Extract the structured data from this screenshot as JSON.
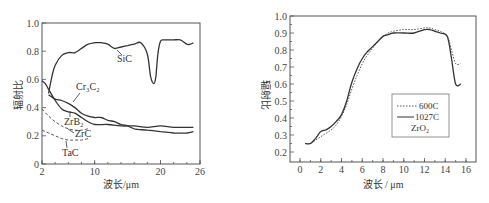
{
  "chart_data": [
    {
      "type": "line",
      "title": "",
      "xlabel": "波长/μm",
      "ylabel": "辐射比",
      "xlim": [
        2,
        26
      ],
      "ylim": [
        0,
        1.0
      ],
      "x_ticks": [
        "2",
        "10",
        "20",
        "26"
      ],
      "x_tick_values": [
        2,
        10,
        20,
        26
      ],
      "y_ticks": [
        "0",
        "0.2",
        "0.4",
        "0.6",
        "0.8",
        "1.0"
      ],
      "y_tick_values": [
        0,
        0.2,
        0.4,
        0.6,
        0.8,
        1.0
      ],
      "grid": false,
      "series": [
        {
          "name": "SiC",
          "style": "solid",
          "label": "SiC",
          "x": [
            3,
            3.5,
            4,
            5,
            6,
            7,
            8,
            9,
            10,
            11,
            12,
            13,
            14,
            15,
            16,
            17,
            18,
            18.5,
            19,
            19.3,
            19.6,
            20,
            20.5,
            21,
            22,
            23,
            24,
            24.5,
            25
          ],
          "y": [
            0.5,
            0.62,
            0.7,
            0.77,
            0.79,
            0.79,
            0.82,
            0.85,
            0.86,
            0.86,
            0.85,
            0.82,
            0.83,
            0.84,
            0.85,
            0.86,
            0.78,
            0.62,
            0.57,
            0.62,
            0.78,
            0.87,
            0.88,
            0.88,
            0.88,
            0.88,
            0.85,
            0.85,
            0.86
          ]
        },
        {
          "name": "Cr3C2",
          "style": "solid",
          "label": "Cr₃C₂",
          "x": [
            3,
            4,
            5,
            6,
            7,
            8,
            9,
            10,
            11,
            12,
            13,
            14,
            15,
            16,
            18,
            20,
            22,
            24,
            25
          ],
          "y": [
            0.49,
            0.46,
            0.45,
            0.43,
            0.4,
            0.36,
            0.34,
            0.33,
            0.33,
            0.31,
            0.3,
            0.28,
            0.27,
            0.25,
            0.24,
            0.23,
            0.22,
            0.22,
            0.23
          ]
        },
        {
          "name": "ZrB2",
          "style": "solid",
          "label": "ZrB₂",
          "x": [
            2,
            2.5,
            3,
            4,
            5,
            6,
            7,
            8,
            9,
            10,
            12,
            14,
            16,
            18,
            20,
            22,
            24,
            25
          ],
          "y": [
            0.59,
            0.57,
            0.53,
            0.45,
            0.39,
            0.37,
            0.36,
            0.33,
            0.3,
            0.28,
            0.28,
            0.27,
            0.27,
            0.26,
            0.27,
            0.26,
            0.26,
            0.26
          ]
        },
        {
          "name": "ZrC",
          "style": "dashed",
          "label": "ZrC",
          "x": [
            2,
            3,
            4,
            5,
            6,
            7,
            8,
            9
          ],
          "y": [
            0.39,
            0.34,
            0.3,
            0.27,
            0.25,
            0.24,
            0.24,
            0.25
          ]
        },
        {
          "name": "TaC",
          "style": "dashed",
          "label": "TaC",
          "x": [
            2,
            3,
            4,
            5,
            6,
            7,
            8,
            9
          ],
          "y": [
            0.24,
            0.22,
            0.2,
            0.18,
            0.17,
            0.17,
            0.17,
            0.18
          ]
        }
      ]
    },
    {
      "type": "line",
      "title": "",
      "xlabel": "波长 / μm",
      "ylabel": "辐射比",
      "xlim": [
        -1,
        17
      ],
      "ylim": [
        0.15,
        1.0
      ],
      "x_ticks": [
        "0",
        "2",
        "4",
        "6",
        "8",
        "10",
        "12",
        "14",
        "16"
      ],
      "x_tick_values": [
        0,
        2,
        4,
        6,
        8,
        10,
        12,
        14,
        16
      ],
      "y_ticks": [
        "0.2",
        "0.3",
        "0.4",
        "0.5",
        "0.6",
        "0.7",
        "0.8",
        "0.9",
        "1.0"
      ],
      "y_tick_values": [
        0.2,
        0.3,
        0.4,
        0.5,
        0.6,
        0.7,
        0.8,
        0.9,
        1.0
      ],
      "grid": false,
      "legend": {
        "position": "lower-right",
        "title": "ZrO₂",
        "entries": [
          "600C",
          "1027C"
        ]
      },
      "series": [
        {
          "name": "600C",
          "style": "dotted",
          "x": [
            0.5,
            1,
            1.5,
            2,
            2.5,
            3,
            3.5,
            4,
            4.5,
            5,
            5.5,
            6,
            6.5,
            7,
            7.5,
            8,
            8.5,
            9,
            10,
            11,
            12,
            12.5,
            13,
            13.5,
            14.2,
            14.6,
            15,
            15.5
          ],
          "y": [
            0.25,
            0.25,
            0.27,
            0.29,
            0.31,
            0.33,
            0.36,
            0.41,
            0.48,
            0.57,
            0.65,
            0.72,
            0.77,
            0.81,
            0.85,
            0.88,
            0.9,
            0.91,
            0.92,
            0.92,
            0.93,
            0.93,
            0.92,
            0.91,
            0.88,
            0.8,
            0.72,
            0.72
          ]
        },
        {
          "name": "1027C",
          "style": "solid",
          "x": [
            0.5,
            1,
            1.5,
            2,
            2.5,
            3,
            3.5,
            4,
            4.5,
            5,
            5.5,
            6,
            6.5,
            7,
            7.5,
            8,
            8.5,
            9,
            10,
            11,
            12,
            12.5,
            13,
            13.5,
            14.2,
            14.6,
            15,
            15.5
          ],
          "y": [
            0.25,
            0.25,
            0.28,
            0.32,
            0.33,
            0.35,
            0.38,
            0.42,
            0.5,
            0.61,
            0.69,
            0.75,
            0.79,
            0.82,
            0.85,
            0.88,
            0.89,
            0.9,
            0.9,
            0.9,
            0.92,
            0.92,
            0.91,
            0.9,
            0.88,
            0.75,
            0.6,
            0.6
          ]
        }
      ]
    }
  ]
}
